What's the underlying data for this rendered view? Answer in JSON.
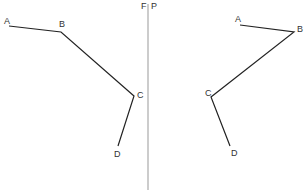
{
  "diagram": {
    "mirror_line": {
      "x": 148,
      "y1": 4,
      "y2": 190,
      "color": "#999999"
    },
    "mirror_labels": [
      {
        "text": "F",
        "x": 141,
        "y": 9
      },
      {
        "text": "P",
        "x": 151,
        "y": 9
      }
    ],
    "left_figure": {
      "points": [
        {
          "label": "A",
          "x": 9,
          "y": 26,
          "lx": 4,
          "ly": 24
        },
        {
          "label": "B",
          "x": 61,
          "y": 32,
          "lx": 59,
          "ly": 27
        },
        {
          "label": "C",
          "x": 134,
          "y": 96,
          "lx": 137,
          "ly": 98
        },
        {
          "label": "D",
          "x": 118,
          "y": 146,
          "lx": 114,
          "ly": 157
        }
      ]
    },
    "right_figure": {
      "points": [
        {
          "label": "A",
          "x": 240,
          "y": 25,
          "lx": 235,
          "ly": 22
        },
        {
          "label": "B",
          "x": 294,
          "y": 32,
          "lx": 297,
          "ly": 32
        },
        {
          "label": "C",
          "x": 211,
          "y": 97,
          "lx": 205,
          "ly": 96
        },
        {
          "label": "D",
          "x": 230,
          "y": 146,
          "lx": 231,
          "ly": 156
        }
      ]
    },
    "line_color": "#222222"
  }
}
